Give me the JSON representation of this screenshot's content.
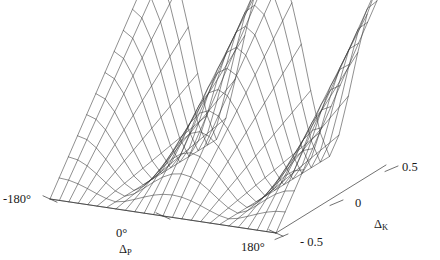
{
  "figure": {
    "background_color": "#ffffff",
    "line_color": "#333333",
    "text_color": "#1a1a1a",
    "width": 440,
    "height": 260
  },
  "axes": {
    "x": {
      "title_base": "Δ",
      "title_sub": "P",
      "ticks": [
        "-180°",
        "0°",
        "180°"
      ]
    },
    "z": {
      "title_base": "Δ",
      "title_sub": "K",
      "ticks": [
        "- 0.5",
        "0",
        "0.5"
      ]
    }
  },
  "chart_data": {
    "type": "surface",
    "title": "",
    "xlabel": "ΔP",
    "ylabel": "ΔK",
    "zlabel": "",
    "xlim": [
      -180,
      180
    ],
    "ylim": [
      -0.5,
      0.5
    ],
    "xtick_labels": [
      "-180°",
      "0°",
      "180°"
    ],
    "xtick_values": [
      -180,
      0,
      180
    ],
    "ytick_labels": [
      "- 0.5",
      "0",
      "0.5"
    ],
    "ytick_values": [
      -0.5,
      0,
      0.5
    ],
    "grid": false,
    "legend": "none",
    "projection": "3d-wireframe",
    "nx": 25,
    "ny": 13,
    "formula": "z(dP, dK) = A * |cos(dP)| ^ p scaled by (dK + 0.5)",
    "peaks": [
      {
        "dP": -180,
        "dK": 0.5,
        "z_rel": 1.0
      },
      {
        "dP": 0,
        "dK": 0.5,
        "z_rel": 1.0
      },
      {
        "dP": 180,
        "dK": 0.5,
        "z_rel": 1.0
      }
    ],
    "valleys": [
      {
        "dP": -90,
        "dK": 0.5,
        "z_rel": 0.0
      },
      {
        "dP": 90,
        "dK": 0.5,
        "z_rel": 0.0
      }
    ],
    "zlim_rel": [
      0,
      1
    ]
  }
}
